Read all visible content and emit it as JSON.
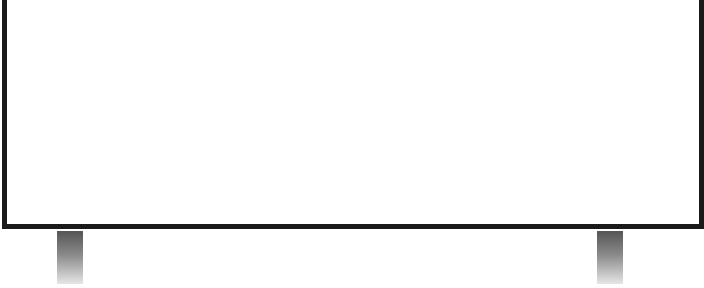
{
  "scene": {
    "subject": "blank whiteboard on stand",
    "colors": {
      "frame": "#1a1a1a",
      "surface": "#ffffff",
      "leg_top": "#555555",
      "leg_bottom": "#e6e6e6"
    },
    "legs": [
      {
        "position": "left"
      },
      {
        "position": "right"
      }
    ]
  }
}
